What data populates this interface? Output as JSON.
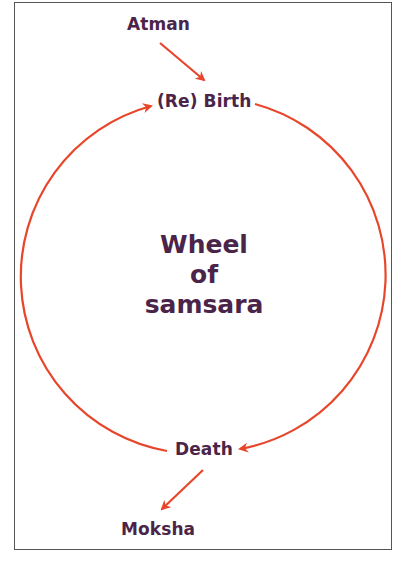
{
  "diagram": {
    "title_lines": [
      "Wheel",
      "of",
      "samsara"
    ],
    "nodes": {
      "atman": "Atman",
      "rebirth": "(Re) Birth",
      "death": "Death",
      "moksha": "Moksha"
    },
    "edges": [
      {
        "from": "Atman",
        "to": "(Re) Birth",
        "type": "straight-arrow"
      },
      {
        "from": "(Re) Birth",
        "to": "Death",
        "type": "arc-arrow",
        "side": "right"
      },
      {
        "from": "Death",
        "to": "(Re) Birth",
        "type": "arc-arrow",
        "side": "left"
      },
      {
        "from": "Death",
        "to": "Moksha",
        "type": "straight-arrow"
      }
    ],
    "colors": {
      "text": "#4b2449",
      "arrow": "#e8462b",
      "border": "#555555",
      "background": "#ffffff"
    }
  }
}
